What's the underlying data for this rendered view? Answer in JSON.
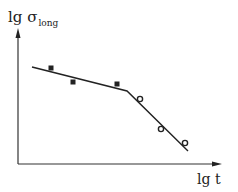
{
  "chart_data": {
    "type": "line",
    "title": "",
    "xlabel": "lg t",
    "ylabel": "lg σ_long",
    "ylabel_main": "lg σ",
    "ylabel_sub": "long",
    "grid": false,
    "legend": null,
    "series": [
      {
        "name": "fit-line",
        "kind": "piecewise-linear",
        "points": [
          [
            32,
            67
          ],
          [
            127,
            91
          ],
          [
            188,
            151
          ]
        ]
      },
      {
        "name": "star-markers",
        "marker": "asterisk",
        "points": [
          [
            51,
            68
          ],
          [
            73,
            82
          ],
          [
            117,
            84
          ]
        ]
      },
      {
        "name": "circle-markers",
        "marker": "circle",
        "points": [
          [
            140,
            99
          ],
          [
            161,
            129
          ],
          [
            185,
            143
          ]
        ]
      }
    ],
    "note": "Qualitative plot without tick values; coordinates are in pixel space"
  },
  "labels": {
    "y_main": "lg σ",
    "y_sub": "long",
    "x": "lg t"
  }
}
